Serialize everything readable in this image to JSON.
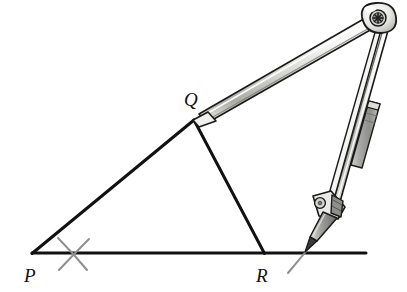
{
  "figure": {
    "background_color": "#ffffff",
    "width": 407,
    "height": 292
  },
  "colors": {
    "ink": "#111111",
    "outline": "#1a1a1a",
    "metal_light": "#f2f2f0",
    "metal_mid": "#b9b9b6",
    "metal_dark": "#8a8a86",
    "sleeve_gray": "#9d9d99",
    "arc_gray": "#8f8f8f",
    "pencil_gray": "#6e6e6e",
    "screw_gray": "#7a7a77"
  },
  "labels": {
    "vertices": [
      {
        "name": "P",
        "text": "P",
        "x": 24,
        "y": 280
      },
      {
        "name": "Q",
        "text": "Q",
        "x": 186,
        "y": 104
      },
      {
        "name": "R",
        "text": "R",
        "x": 256,
        "y": 280
      }
    ]
  },
  "geometry": {
    "points": {
      "P": {
        "x": 32,
        "y": 253
      },
      "Q": {
        "x": 194,
        "y": 120
      },
      "R": {
        "x": 264,
        "y": 253
      }
    },
    "baseline": {
      "x1": 32,
      "y1": 253,
      "x2": 366,
      "y2": 253
    },
    "segments": [
      {
        "name": "side-PQ",
        "x1": 32,
        "y1": 253,
        "x2": 194,
        "y2": 120
      },
      {
        "name": "side-QR",
        "x1": 194,
        "y1": 120,
        "x2": 264,
        "y2": 253
      },
      {
        "name": "side-PR",
        "x1": 32,
        "y1": 253,
        "x2": 264,
        "y2": 253
      }
    ],
    "arc_marks": [
      {
        "name": "arc-mark-left-a",
        "x1": 57,
        "y1": 239,
        "x2": 87,
        "y2": 269
      },
      {
        "name": "arc-mark-left-b",
        "x1": 88,
        "y1": 240,
        "x2": 58,
        "y2": 270
      },
      {
        "name": "arc-mark-right",
        "x1": 319,
        "y1": 235,
        "x2": 288,
        "y2": 272
      }
    ]
  },
  "compass": {
    "pivot": {
      "x": 378,
      "y": 19,
      "radius": 11,
      "screw_radius": 6
    },
    "left_arm": {
      "name": "compass-left-arm",
      "tip_x": 196,
      "tip_y": 119,
      "hinge_x": 371,
      "hinge_y": 24,
      "half_width": 5
    },
    "right_arm": {
      "name": "compass-right-arm",
      "tip_x": 326,
      "tip_y": 206,
      "hinge_x": 377,
      "hinge_y": 27,
      "half_width": 5
    },
    "sleeve": {
      "name": "compass-extension-sleeve",
      "cx": 360,
      "cy": 135,
      "length": 58,
      "width": 9
    },
    "pencil": {
      "name": "compass-pencil",
      "tip_x": 305,
      "tip_y": 244,
      "top_x": 328,
      "top_y": 209,
      "lead_length": 14
    },
    "clamp": {
      "name": "compass-pencil-clamp",
      "cx": 327,
      "cy": 206
    }
  }
}
